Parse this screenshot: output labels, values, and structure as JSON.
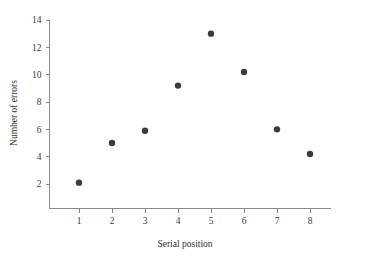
{
  "chart_data": {
    "type": "scatter",
    "title": "",
    "xlabel": "Serial position",
    "ylabel": "Number of errors",
    "x": [
      1,
      2,
      3,
      4,
      5,
      6,
      7,
      8
    ],
    "values": [
      2.1,
      5.0,
      5.9,
      9.2,
      13.0,
      10.2,
      6.0,
      4.2
    ],
    "points": [
      {
        "x": 1,
        "y": 2.1
      },
      {
        "x": 2,
        "y": 5.0
      },
      {
        "x": 3,
        "y": 5.9
      },
      {
        "x": 4,
        "y": 9.2
      },
      {
        "x": 5,
        "y": 13.0
      },
      {
        "x": 6,
        "y": 10.2
      },
      {
        "x": 7,
        "y": 6.0
      },
      {
        "x": 8,
        "y": 4.2
      }
    ],
    "xticks": [
      1,
      2,
      3,
      4,
      5,
      6,
      7,
      8
    ],
    "yticks": [
      2,
      4,
      6,
      8,
      10,
      12,
      14
    ],
    "xlim": [
      0.5,
      8.8
    ],
    "ylim": [
      0.6,
      14.6
    ],
    "grid": false,
    "legend": null,
    "marker": "filled-circle",
    "marker_color": "#3b3b3b",
    "axis_color": "#8a8a8a",
    "background_color": "#ffffff"
  }
}
